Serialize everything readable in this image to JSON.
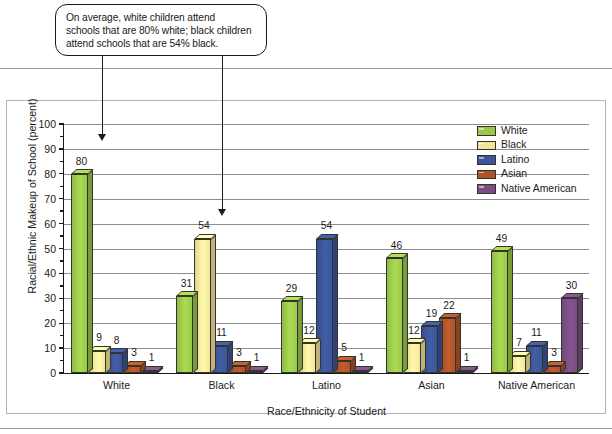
{
  "callout": {
    "lines": [
      "On average, white children attend",
      "schools that are 80% white; black children",
      "attend schools that are 54% black."
    ]
  },
  "chart_data": {
    "type": "bar",
    "title": "",
    "xlabel": "Race/Ethnicity of Student",
    "ylabel": "Racial/Ethnic Makeup of School (percent)",
    "ylim": [
      0,
      100
    ],
    "yticks": [
      "100",
      "90",
      "80",
      "70",
      "60",
      "50",
      "40",
      "30",
      "20",
      "10",
      "0"
    ],
    "grid": true,
    "legend_position": "top-right",
    "categories": [
      "White",
      "Black",
      "Latino",
      "Asian",
      "Native American"
    ],
    "series": [
      {
        "name": "White",
        "color": "#9BC84B",
        "values": [
          80,
          31,
          29,
          46,
          49
        ]
      },
      {
        "name": "Black",
        "color": "#F3E49B",
        "values": [
          9,
          54,
          12,
          12,
          7
        ]
      },
      {
        "name": "Latino",
        "color": "#3B5598",
        "values": [
          8,
          11,
          54,
          19,
          11
        ]
      },
      {
        "name": "Asian",
        "color": "#AF5329",
        "values": [
          3,
          3,
          5,
          22,
          3
        ]
      },
      {
        "name": "Native American",
        "color": "#7A4D83",
        "values": [
          1,
          1,
          1,
          1,
          30
        ]
      }
    ]
  }
}
